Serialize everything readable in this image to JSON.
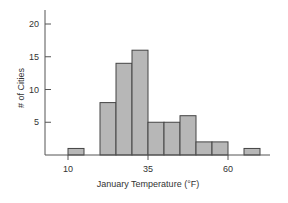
{
  "chart_data": {
    "type": "bar",
    "subtype": "histogram",
    "title": "",
    "xlabel": "January Temperature (°F)",
    "ylabel": "# of Cities",
    "bin_width": 5,
    "bins": [
      {
        "start": 10,
        "end": 15,
        "count": 1
      },
      {
        "start": 15,
        "end": 20,
        "count": 0
      },
      {
        "start": 20,
        "end": 25,
        "count": 8
      },
      {
        "start": 25,
        "end": 30,
        "count": 14
      },
      {
        "start": 30,
        "end": 35,
        "count": 16
      },
      {
        "start": 35,
        "end": 40,
        "count": 5
      },
      {
        "start": 40,
        "end": 45,
        "count": 5
      },
      {
        "start": 45,
        "end": 50,
        "count": 6
      },
      {
        "start": 50,
        "end": 55,
        "count": 2
      },
      {
        "start": 55,
        "end": 60,
        "count": 2
      },
      {
        "start": 60,
        "end": 65,
        "count": 0
      },
      {
        "start": 65,
        "end": 70,
        "count": 1
      }
    ],
    "categories": [
      "10-15",
      "15-20",
      "20-25",
      "25-30",
      "30-35",
      "35-40",
      "40-45",
      "45-50",
      "50-55",
      "55-60",
      "60-65",
      "65-70"
    ],
    "values": [
      1,
      0,
      8,
      14,
      16,
      5,
      5,
      6,
      2,
      2,
      0,
      1
    ],
    "x_ticks": [
      10,
      35,
      60
    ],
    "y_ticks": [
      5,
      10,
      15,
      20
    ],
    "xlim": [
      0,
      72
    ],
    "ylim": [
      0,
      23
    ],
    "grid": false,
    "legend": null,
    "colors": {
      "bar_fill": "#b7b7b7",
      "bar_stroke": "#444444",
      "axis": "#555555"
    }
  }
}
